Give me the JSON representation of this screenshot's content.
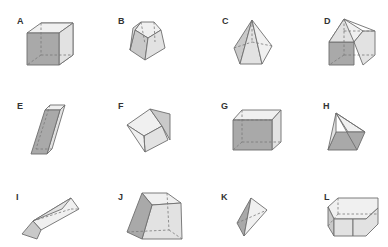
{
  "figure": {
    "colors": {
      "dark_face": "#a9a9a9",
      "mid_face": "#c9c9c9",
      "light_face": "#e2e2e2",
      "edge": "#6e6e6e",
      "label": "#333333",
      "background": "#ffffff"
    },
    "solids": [
      {
        "label": "A",
        "shape": "cube"
      },
      {
        "label": "B",
        "shape": "pentagonal frustum (truncated pyramid)"
      },
      {
        "label": "C",
        "shape": "pentagonal pyramid"
      },
      {
        "label": "D",
        "shape": "pentagonal prism (house shape)"
      },
      {
        "label": "E",
        "shape": "oblique rectangular prism"
      },
      {
        "label": "F",
        "shape": "triangular prism (tilted)"
      },
      {
        "label": "G",
        "shape": "rectangular prism with slanted top"
      },
      {
        "label": "H",
        "shape": "quadrilateral pyramid (tilted)"
      },
      {
        "label": "I",
        "shape": "triangular prism with pointed end"
      },
      {
        "label": "J",
        "shape": "trapezoidal prism / frustum"
      },
      {
        "label": "K",
        "shape": "triangular bipyramid / tetrahedron"
      },
      {
        "label": "L",
        "shape": "hexagonal prism"
      }
    ]
  }
}
